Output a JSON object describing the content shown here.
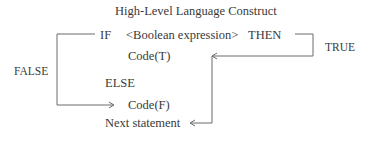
{
  "diagram": {
    "title": "High-Level Language Construct",
    "lines": {
      "if": "IF",
      "condition": "<Boolean expression>",
      "then": "THEN",
      "code_true": "Code(T)",
      "else": "ELSE",
      "code_false": "Code(F)",
      "next": "Next statement"
    },
    "labels": {
      "true": "TRUE",
      "false": "FALSE"
    },
    "colors": {
      "text": "#3a3a3a",
      "line": "#6a6a6a"
    }
  }
}
